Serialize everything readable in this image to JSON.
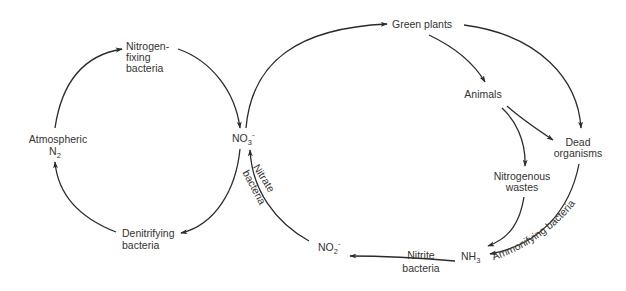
{
  "diagram": {
    "colors": {
      "line": "#2b2b2b",
      "text": "#333333",
      "background": "#ffffff"
    },
    "nodes": {
      "nitrogen_fixing": {
        "line1": "Nitrogen-",
        "line2": "fixing",
        "line3": "bacteria"
      },
      "atmospheric": {
        "line1": "Atmospheric",
        "base": "N",
        "sub": "2"
      },
      "no3": {
        "base": "NO",
        "sub": "3",
        "sup": "-"
      },
      "denitrifying": {
        "line1": "Denitrifying",
        "line2": "bacteria"
      },
      "green_plants": {
        "label": "Green plants"
      },
      "animals": {
        "label": "Animals"
      },
      "dead_organisms": {
        "line1": "Dead",
        "line2": "organisms"
      },
      "nitrogenous_wastes": {
        "line1": "Nitrogenous",
        "line2": "wastes"
      },
      "nh3": {
        "base": "NH",
        "sub": "3"
      },
      "no2": {
        "base": "NO",
        "sub": "2",
        "sup": "-"
      }
    },
    "edge_labels": {
      "nitrite_bacteria": {
        "line1": "Nitrite",
        "line2": "bacteria"
      },
      "nitrate_bacteria": {
        "line1": "Nitrate",
        "line2": "bacteria"
      },
      "ammonifying_bacteria": {
        "label": "Ammonifying bacteria"
      }
    },
    "edges": [
      {
        "from": "Atmospheric N2",
        "to": "Nitrogen-fixing bacteria"
      },
      {
        "from": "Nitrogen-fixing bacteria",
        "to": "NO3-"
      },
      {
        "from": "NO3-",
        "to": "Denitrifying bacteria"
      },
      {
        "from": "Denitrifying bacteria",
        "to": "Atmospheric N2"
      },
      {
        "from": "NO3-",
        "to": "Green plants"
      },
      {
        "from": "Green plants",
        "to": "Animals"
      },
      {
        "from": "Green plants",
        "to": "Dead organisms"
      },
      {
        "from": "Animals",
        "to": "Dead organisms"
      },
      {
        "from": "Animals",
        "to": "Nitrogenous wastes"
      },
      {
        "from": "Nitrogenous wastes",
        "to": "NH3"
      },
      {
        "from": "Dead organisms",
        "to": "NH3",
        "label": "Ammonifying bacteria"
      },
      {
        "from": "NH3",
        "to": "NO2-",
        "label": "Nitrite bacteria"
      },
      {
        "from": "NO2-",
        "to": "NO3-",
        "label": "Nitrate bacteria"
      }
    ]
  }
}
